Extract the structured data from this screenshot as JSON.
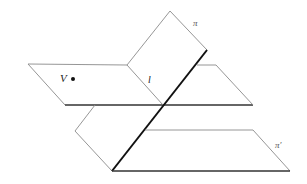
{
  "figure": {
    "type": "geometric-diagram",
    "labels": {
      "plane_pi": "π",
      "point_V": "V",
      "line_l": "l",
      "plane_pi_prime": "π′"
    }
  }
}
